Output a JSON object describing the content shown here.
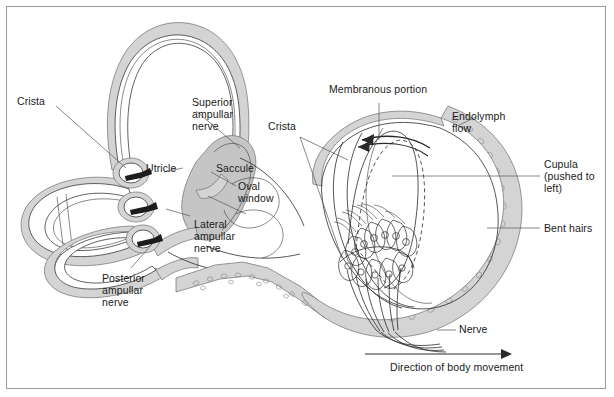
{
  "figure": {
    "background_color": "#ffffff",
    "border_color": "#9a9a9a",
    "ink_color": "#1a1a1a",
    "shade_light": "#d8d8d8",
    "shade_mid": "#c3c3c3",
    "shade_dark": "#a8a8a8"
  },
  "left_panel": {
    "name": "bony-membranous-labyrinth",
    "labels": {
      "crista": "Crista",
      "superior_ampullar_nerve": "Superior\nampullar\nnerve",
      "utricle": "Utricle",
      "saccule": "Saccule",
      "oval_window": "Oval\nwindow",
      "lateral_ampullar_nerve": "Lateral\nampullar\nnerve",
      "posterior_ampullar_nerve": "Posterior\nampullar\nnerve"
    }
  },
  "right_panel": {
    "name": "ampulla-cupula-detail",
    "labels": {
      "membranous_portion": "Membranous portion",
      "crista": "Crista",
      "endolymph_flow": "Endolymph\nflow",
      "cupula": "Cupula\n(pushed to left)",
      "bent_hairs": "Bent hairs",
      "nerve": "Nerve",
      "direction_of_body_movement": "Direction of body movement"
    }
  }
}
